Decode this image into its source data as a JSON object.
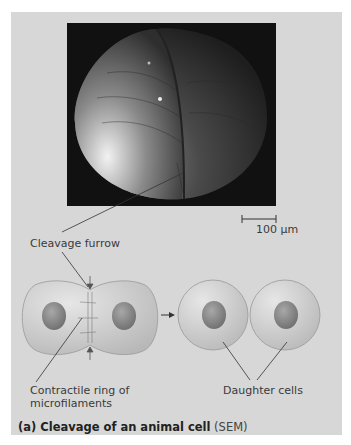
{
  "figure": {
    "micrograph": {
      "type": "SEM",
      "subject": "dividing animal cell showing cleavage furrow",
      "scale_bar": {
        "label": "100 µm"
      }
    },
    "labels": {
      "cleavage_furrow": "Cleavage furrow",
      "contractile_ring_line1": "Contractile ring of",
      "contractile_ring_line2": "microfilaments",
      "daughter_cells": "Daughter cells"
    },
    "caption": {
      "bold": "(a) Cleavage of an animal cell",
      "normal": " (SEM)"
    },
    "colors": {
      "panel_bg": "#d7d7d7",
      "micrograph_bg": "#111111",
      "cell_fill": "#c9c9c9",
      "nucleus": "#8a8a8a",
      "text": "#3a3a3a"
    }
  }
}
